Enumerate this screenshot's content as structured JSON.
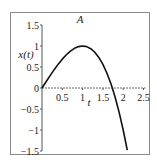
{
  "chart_data": {
    "type": "line",
    "title": "A",
    "xlabel": "t",
    "ylabel": "x(t)",
    "xlim": [
      0,
      2.5
    ],
    "ylim": [
      -1.5,
      1.5
    ],
    "xticks": [
      0.5,
      1,
      1.5,
      2,
      2.5
    ],
    "xtick_labels": [
      "0.5",
      "1",
      "1.5",
      "2",
      "2.5"
    ],
    "yticks": [
      1.5,
      1,
      0.5,
      0,
      -0.5,
      -1,
      -1.5
    ],
    "ytick_labels": [
      "1.5",
      "1",
      "0.5",
      "0",
      "−0.5",
      "−1",
      "−1.5"
    ],
    "grid": false,
    "legend": "none",
    "series": [
      {
        "name": "x(t)",
        "color": "#111111",
        "x": [
          0,
          0.1,
          0.2,
          0.3,
          0.4,
          0.5,
          0.6,
          0.7,
          0.8,
          0.9,
          1.0,
          1.1,
          1.2,
          1.3,
          1.4,
          1.5,
          1.6,
          1.7,
          1.732,
          1.8,
          1.9,
          2.0,
          2.1
        ],
        "y": [
          0,
          0.1495,
          0.296,
          0.4365,
          0.568,
          0.6875,
          0.792,
          0.8785,
          0.944,
          0.9855,
          1.0,
          0.9845,
          0.936,
          0.8515,
          0.728,
          0.5625,
          0.352,
          0.0935,
          0,
          -0.216,
          -0.5795,
          -1.0,
          -1.4805
        ]
      }
    ]
  }
}
